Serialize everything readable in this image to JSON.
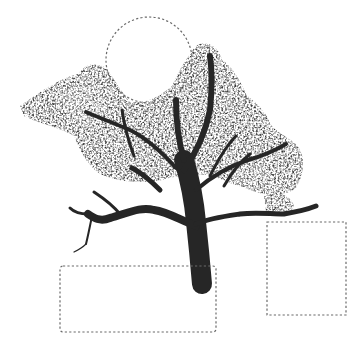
{
  "image": {
    "subject": "grayscale tree",
    "background": "#ffffff",
    "width": 361,
    "height": 345
  },
  "annotations": [
    {
      "shape": "circle",
      "label": "sky-region",
      "cx": 149,
      "cy": 60,
      "r": 43
    },
    {
      "shape": "rect",
      "label": "ground-left-region",
      "x": 60,
      "y": 266,
      "w": 156,
      "h": 66
    },
    {
      "shape": "rect",
      "label": "ground-right-region",
      "x": 267,
      "y": 222,
      "w": 79,
      "h": 93
    }
  ],
  "style": {
    "annotation_color": "#6a6a6a",
    "foliage_color": "#3a3a3a",
    "foliage_light": "#7a7a7a",
    "trunk_color": "#262626"
  }
}
